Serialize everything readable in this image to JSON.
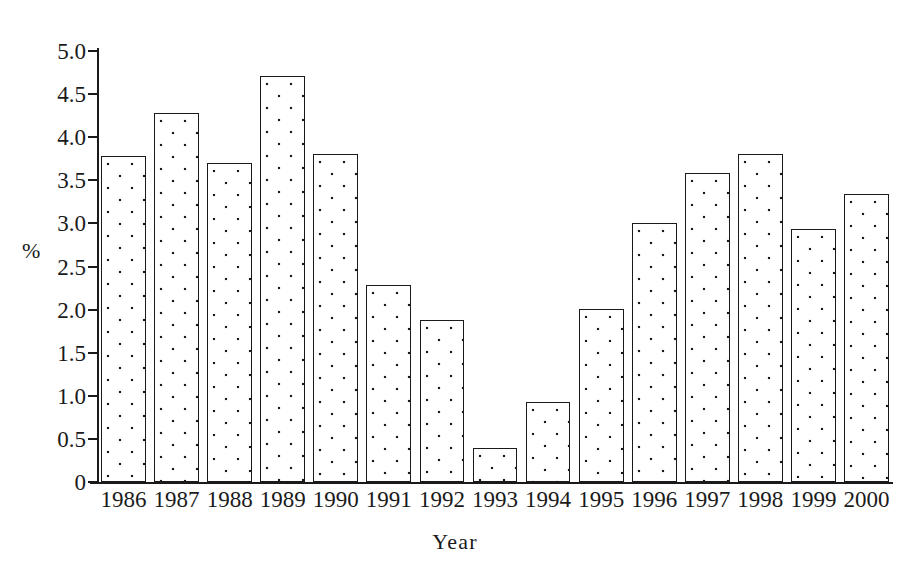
{
  "chart_data": {
    "type": "bar",
    "title": "",
    "xlabel": "Year",
    "ylabel": "%",
    "categories": [
      "1986",
      "1987",
      "1988",
      "1989",
      "1990",
      "1991",
      "1992",
      "1993",
      "1994",
      "1995",
      "1996",
      "1997",
      "1998",
      "1999",
      "2000"
    ],
    "values": [
      3.78,
      4.28,
      3.7,
      4.71,
      3.81,
      2.29,
      1.88,
      0.39,
      0.93,
      2.01,
      3.01,
      3.59,
      3.8,
      2.94,
      3.34
    ],
    "ylim": [
      0,
      5.0
    ],
    "ytick_labels": [
      "5.0",
      "4.5",
      "4.0",
      "3.5",
      "3.0",
      "2.5",
      "2.0",
      "1.5",
      "1.0",
      "0.5",
      "0"
    ],
    "ytick_values": [
      5.0,
      4.5,
      4.0,
      3.5,
      3.0,
      2.5,
      2.0,
      1.5,
      1.0,
      0.5,
      0
    ],
    "grid": false,
    "legend": null,
    "legend_position": "none",
    "series": [
      {
        "name": "",
        "values": [
          3.78,
          4.28,
          3.7,
          4.71,
          3.81,
          2.29,
          1.88,
          0.39,
          0.93,
          2.01,
          3.01,
          3.59,
          3.8,
          2.94,
          3.34
        ]
      }
    ],
    "style": {
      "bar_fill": "#ffffff",
      "bar_pattern": "dotted-stipple",
      "bar_border": "#1a1a1a",
      "axis_color": "#1a1a1a",
      "background": "#ffffff"
    }
  }
}
